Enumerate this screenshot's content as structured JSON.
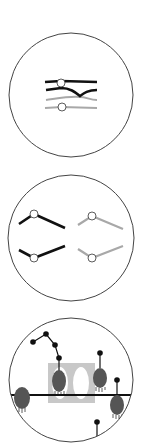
{
  "colors": {
    "background": "#ffffff",
    "outline": "#444444",
    "black_strand": "#111111",
    "gray_strand": "#a8a8a8",
    "node_fill": "#ffffff",
    "organism_fill": "#555555",
    "highlight_box": "#c8c8c8"
  },
  "panels": [
    {
      "id": "panel-1",
      "description": "crossover of paired strands (black pair over gray pair) with open-circle junctions",
      "circle": {
        "cx": 71,
        "cy": 95,
        "r": 62
      }
    },
    {
      "id": "panel-2",
      "description": "four separated bent segments with open-circle joints; left pair black, right pair gray",
      "circle": {
        "cx": 71,
        "cy": 238,
        "r": 63
      }
    },
    {
      "id": "panel-3",
      "description": "dark oval bodies on stalks with dot chains along a horizontal line; gray box with two white ovals",
      "circle": {
        "cx": 71,
        "cy": 380,
        "r": 62
      }
    }
  ]
}
